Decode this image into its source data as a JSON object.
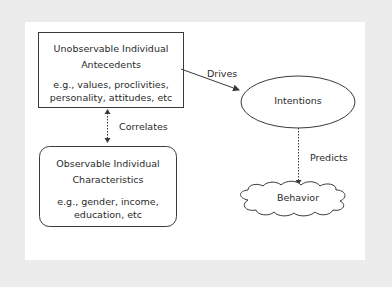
{
  "diagram": {
    "nodes": {
      "antecedents": {
        "title_line1": "Unobservable Individual",
        "title_line2": "Antecedents",
        "examples_line1": "e.g., values, proclivities,",
        "examples_line2": "personality, attitudes, etc",
        "shape": "rectangle"
      },
      "characteristics": {
        "title_line1": "Observable Individual",
        "title_line2": "Characteristics",
        "examples_line1": "e.g., gender, income,",
        "examples_line2": "education, etc",
        "shape": "rounded-rectangle"
      },
      "intentions": {
        "label": "Intentions",
        "shape": "ellipse"
      },
      "behavior": {
        "label": "Behavior",
        "shape": "cloud"
      }
    },
    "edges": {
      "drives": {
        "label": "Drives",
        "from": "antecedents",
        "to": "intentions",
        "style": "solid"
      },
      "correlates": {
        "label": "Correlates",
        "from": "antecedents",
        "to": "characteristics",
        "style": "dotted-bidirectional"
      },
      "predicts": {
        "label": "Predicts",
        "from": "intentions",
        "to": "behavior",
        "style": "dotted"
      }
    },
    "colors": {
      "frame": "#ececec",
      "panel": "#ffffff",
      "stroke": "#3a3a3a",
      "text": "#2a2a2a"
    }
  }
}
